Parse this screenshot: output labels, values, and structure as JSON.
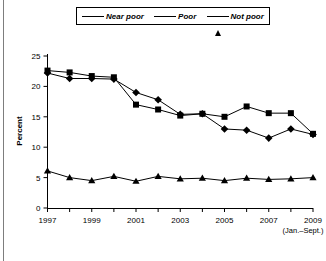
{
  "figure": {
    "title": "",
    "ylabel": "Percent",
    "xnote": "(Jan.–Sept.)"
  },
  "legend": {
    "items": [
      {
        "label": "Near poor",
        "marker": "square"
      },
      {
        "label": "Poor",
        "marker": "diamond"
      },
      {
        "label": "Not poor",
        "marker": "triangle"
      }
    ]
  },
  "axes": {
    "y_ticks": [
      "0",
      "5",
      "10",
      "15",
      "20",
      "25"
    ],
    "x_ticks": [
      "1997",
      "1999",
      "2001",
      "2003",
      "2005",
      "2007",
      "2009"
    ]
  },
  "chart_data": {
    "type": "line",
    "title": "",
    "xlabel": "",
    "ylabel": "Percent",
    "xlim": [
      1997,
      2009
    ],
    "ylim": [
      0,
      25
    ],
    "grid": false,
    "legend_position": "top",
    "x": [
      1997,
      1998,
      1999,
      2000,
      2001,
      2002,
      2003,
      2004,
      2005,
      2006,
      2007,
      2008,
      2009
    ],
    "x_tick_labels": [
      "1997",
      "",
      "1999",
      "",
      "2001",
      "",
      "2003",
      "",
      "2005",
      "",
      "2007",
      "",
      "2009"
    ],
    "y_tick_values": [
      0,
      5,
      10,
      15,
      20,
      25
    ],
    "annotations": [
      "(Jan.–Sept.)"
    ],
    "series": [
      {
        "name": "Near poor",
        "marker": "square",
        "values": [
          22.6,
          22.3,
          21.7,
          21.5,
          17.0,
          16.2,
          15.2,
          15.5,
          15.0,
          16.7,
          15.6,
          15.6,
          12.2
        ]
      },
      {
        "name": "Poor",
        "marker": "diamond",
        "values": [
          22.2,
          21.3,
          21.3,
          21.2,
          19.0,
          17.8,
          15.4,
          15.5,
          13.0,
          12.8,
          11.5,
          13.0,
          12.1
        ]
      },
      {
        "name": "Not poor",
        "marker": "triangle",
        "values": [
          6.1,
          5.0,
          4.5,
          5.2,
          4.4,
          5.2,
          4.8,
          4.9,
          4.5,
          4.9,
          4.7,
          4.8,
          5.0
        ]
      }
    ]
  }
}
